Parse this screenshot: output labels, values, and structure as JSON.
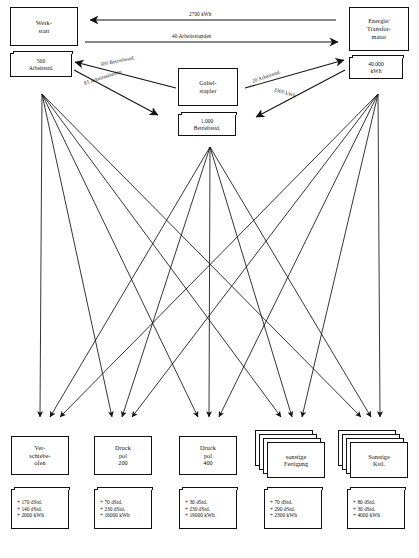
{
  "diagram": {
    "type": "cost-center-flow-diagram"
  },
  "sources": [
    {
      "id": "werkstatt",
      "title_lines": [
        "Werk-",
        "statt"
      ],
      "value_lines": [
        "500",
        "Arbeitsstd."
      ]
    },
    {
      "id": "gabelstapler",
      "title_lines": [
        "Gabel-",
        "stapler"
      ],
      "value_lines": [
        "1.000",
        "Betriebsstd."
      ]
    },
    {
      "id": "energie",
      "title_lines": [
        "Energie/",
        "Transfor-",
        "mator"
      ],
      "value_lines": [
        "40.000",
        "kWh"
      ]
    }
  ],
  "edges": [
    {
      "id": "energie-to-werkstatt",
      "label": "2700 kWh"
    },
    {
      "id": "werkstatt-to-energie",
      "label": "40 Arbeitsstunden"
    },
    {
      "id": "stapler-to-werkstatt",
      "label": "300 Betriebsstd."
    },
    {
      "id": "werkstatt-to-stapler",
      "label": "85 Arbeitsstunden"
    },
    {
      "id": "stapler-to-energie",
      "label": "20 Arbeitsstd."
    },
    {
      "id": "energie-to-stapler",
      "label": "2300 kWh"
    }
  ],
  "targets": [
    {
      "id": "verschiebeofen",
      "title_lines": [
        "Ver-",
        "schiebe-",
        "ofen"
      ],
      "values": [
        "+ 170 dStd.",
        "+ 140 dStd.",
        "+ 2000 kWh"
      ],
      "stacked": false
    },
    {
      "id": "druckpol-200",
      "title_lines": [
        "Druck",
        "pol",
        "200"
      ],
      "values": [
        "+ 70 dStd.",
        "+ 230 dStd.",
        "+ 16000 kWh"
      ],
      "stacked": false
    },
    {
      "id": "druckpol-400",
      "title_lines": [
        "Druck",
        "pol",
        "400"
      ],
      "values": [
        "+ 30 dStd.",
        "+ 230 dStd.",
        "+ 19000 kWh"
      ],
      "stacked": false
    },
    {
      "id": "sonstige-fertigung",
      "title_lines": [
        "sonstige",
        "Fertigung"
      ],
      "values": [
        "+ 70 dStd.",
        "+ 290 dStd.",
        "+ 2300 kWh"
      ],
      "stacked": true
    },
    {
      "id": "sonstige-kstl",
      "title_lines": [
        "Sonstige",
        "Kstl."
      ],
      "values": [
        "+ 80 dStd.",
        "+ 30 dStd.",
        "+ 4000 kWh"
      ],
      "stacked": true
    }
  ]
}
